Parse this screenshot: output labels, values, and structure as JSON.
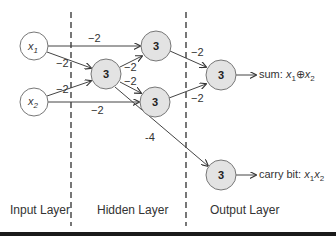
{
  "diagram": {
    "type": "neural-network",
    "layers": [
      {
        "name": "input",
        "label": "Input Layer"
      },
      {
        "name": "hidden",
        "label": "Hidden Layer"
      },
      {
        "name": "output",
        "label": "Output Layer"
      }
    ],
    "nodes": {
      "x1": {
        "label": "x",
        "sub": "1"
      },
      "x2": {
        "label": "x",
        "sub": "2"
      },
      "h_mid": {
        "value": "3"
      },
      "h_top": {
        "value": "3"
      },
      "h_bot": {
        "value": "3"
      },
      "o_sum": {
        "value": "3"
      },
      "o_carry": {
        "value": "3"
      }
    },
    "edges": [
      {
        "from": "x1",
        "to": "h_top",
        "weight": "−2"
      },
      {
        "from": "x1",
        "to": "h_mid",
        "weight": "−2"
      },
      {
        "from": "x2",
        "to": "h_mid",
        "weight": "−2"
      },
      {
        "from": "x2",
        "to": "h_bot",
        "weight": "−2"
      },
      {
        "from": "h_mid",
        "to": "h_top",
        "weight": "−2"
      },
      {
        "from": "h_mid",
        "to": "h_bot",
        "weight": "−2"
      },
      {
        "from": "h_mid",
        "to": "o_carry",
        "weight": "-4"
      },
      {
        "from": "h_top",
        "to": "o_sum",
        "weight": "−2"
      },
      {
        "from": "h_bot",
        "to": "o_sum",
        "weight": "−2"
      }
    ],
    "outputs": {
      "sum": {
        "prefix": "sum: ",
        "expr_a": "x",
        "sub_a": "1",
        "op": "⊕",
        "expr_b": "x",
        "sub_b": "2"
      },
      "carry": {
        "prefix": "carry bit: ",
        "expr_a": "x",
        "sub_a": "1",
        "op": "",
        "expr_b": "x",
        "sub_b": "2"
      }
    }
  }
}
